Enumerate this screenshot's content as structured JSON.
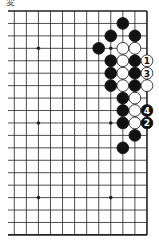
{
  "diagram": {
    "title": "変",
    "board": {
      "visible_columns": 12,
      "visible_rows": 19,
      "right_edge": true,
      "top_edge": true,
      "bottom_edge": true,
      "left_edge": false,
      "grid_color": "#222222",
      "stone_black": "#111111",
      "stone_white": "#ffffff",
      "star_points": [
        {
          "col": 2,
          "row": 3
        },
        {
          "col": 8,
          "row": 3
        },
        {
          "col": 2,
          "row": 9
        },
        {
          "col": 8,
          "row": 9
        },
        {
          "col": 2,
          "row": 15
        },
        {
          "col": 8,
          "row": 15
        }
      ]
    },
    "stones": [
      {
        "color": "black",
        "col": 9,
        "row": 1,
        "label": ""
      },
      {
        "color": "black",
        "col": 8,
        "row": 2,
        "label": ""
      },
      {
        "color": "black",
        "col": 10,
        "row": 2,
        "label": ""
      },
      {
        "color": "black",
        "col": 7,
        "row": 3,
        "label": ""
      },
      {
        "color": "white",
        "col": 9,
        "row": 3,
        "label": ""
      },
      {
        "color": "white",
        "col": 10,
        "row": 3,
        "label": ""
      },
      {
        "color": "black",
        "col": 8,
        "row": 4,
        "label": ""
      },
      {
        "color": "white",
        "col": 9,
        "row": 4,
        "label": ""
      },
      {
        "color": "black",
        "col": 10,
        "row": 4,
        "label": ""
      },
      {
        "color": "white",
        "col": 11,
        "row": 4,
        "label": "1"
      },
      {
        "color": "black",
        "col": 8,
        "row": 5,
        "label": ""
      },
      {
        "color": "white",
        "col": 9,
        "row": 5,
        "label": ""
      },
      {
        "color": "black",
        "col": 10,
        "row": 5,
        "label": ""
      },
      {
        "color": "white",
        "col": 11,
        "row": 5,
        "label": "3"
      },
      {
        "color": "black",
        "col": 8,
        "row": 6,
        "label": ""
      },
      {
        "color": "white",
        "col": 9,
        "row": 6,
        "label": ""
      },
      {
        "color": "black",
        "col": 10,
        "row": 6,
        "label": ""
      },
      {
        "color": "white",
        "col": 11,
        "row": 6,
        "label": ""
      },
      {
        "color": "black",
        "col": 9,
        "row": 7,
        "label": ""
      },
      {
        "color": "white",
        "col": 10,
        "row": 7,
        "label": ""
      },
      {
        "color": "black",
        "col": 9,
        "row": 8,
        "label": ""
      },
      {
        "color": "white",
        "col": 10,
        "row": 8,
        "label": ""
      },
      {
        "color": "black",
        "col": 11,
        "row": 8,
        "label": "4"
      },
      {
        "color": "black",
        "col": 9,
        "row": 9,
        "label": ""
      },
      {
        "color": "white",
        "col": 10,
        "row": 9,
        "label": ""
      },
      {
        "color": "black",
        "col": 11,
        "row": 9,
        "label": "2"
      },
      {
        "color": "black",
        "col": 10,
        "row": 10,
        "label": ""
      },
      {
        "color": "black",
        "col": 9,
        "row": 11,
        "label": ""
      }
    ]
  }
}
